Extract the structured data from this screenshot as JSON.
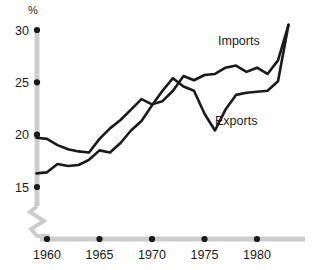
{
  "chart_data": {
    "type": "line",
    "title": "",
    "xlabel": "",
    "ylabel": "%",
    "unit_label": "%",
    "xlim": [
      1959,
      1983
    ],
    "ylim": [
      14.2,
      31.2
    ],
    "grid": false,
    "legend_position": "inline-labels",
    "x_ticks": [
      1960,
      1965,
      1970,
      1975,
      1980
    ],
    "x_tick_labels": [
      "1960",
      "1965",
      "1970",
      "1975",
      "1980"
    ],
    "y_ticks": [
      15,
      20,
      25,
      30
    ],
    "y_tick_labels": [
      "15",
      "20",
      "25",
      "30"
    ],
    "axis_break": true,
    "x": [
      1959,
      1960,
      1961,
      1962,
      1963,
      1964,
      1965,
      1966,
      1967,
      1968,
      1969,
      1970,
      1971,
      1972,
      1973,
      1974,
      1975,
      1976,
      1977,
      1978,
      1979,
      1980,
      1981,
      1982,
      1983
    ],
    "series": [
      {
        "name": "Imports",
        "label": "Imports",
        "values": [
          19.7,
          19.6,
          19.0,
          18.6,
          18.4,
          18.3,
          19.6,
          20.6,
          21.4,
          22.4,
          23.4,
          22.9,
          23.2,
          24.2,
          25.6,
          25.2,
          25.7,
          25.8,
          26.4,
          26.6,
          26.0,
          26.4,
          25.8,
          27.1,
          30.5
        ]
      },
      {
        "name": "Exports",
        "label": "Exports",
        "values": [
          16.3,
          16.4,
          17.2,
          17.0,
          17.1,
          17.6,
          18.5,
          18.3,
          19.2,
          20.4,
          21.3,
          22.8,
          24.2,
          25.4,
          24.6,
          24.2,
          22.0,
          20.4,
          22.4,
          23.8,
          24.0,
          24.1,
          24.2,
          25.1,
          30.5
        ]
      }
    ]
  },
  "labels": {
    "imports": "Imports",
    "exports": "Exports",
    "percent_symbol": "%"
  }
}
